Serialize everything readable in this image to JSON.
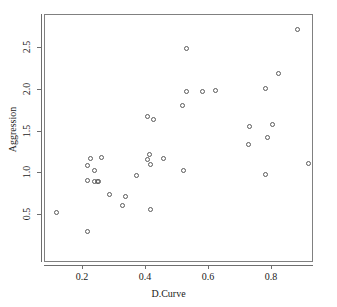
{
  "chart_data": {
    "type": "scatter",
    "title": "",
    "xlabel": "D.Curve",
    "ylabel": "Aggression",
    "xlim": [
      0.1,
      0.93
    ],
    "ylim": [
      0.28,
      2.8
    ],
    "xticks": [
      0.2,
      0.4,
      0.6,
      0.8
    ],
    "xtick_labels": [
      "0.2",
      "0.4",
      "0.6",
      "0.8"
    ],
    "yticks": [
      0.5,
      1.0,
      1.5,
      2.0,
      2.5
    ],
    "ytick_labels": [
      "0.5",
      "1.0",
      "1.5",
      "2.0",
      "2.5"
    ],
    "grid": false,
    "legend": null,
    "marker": "open-circle",
    "marker_color": "#5a5a5a",
    "points": [
      {
        "x": 0.115,
        "y": 0.53
      },
      {
        "x": 0.215,
        "y": 0.3
      },
      {
        "x": 0.285,
        "y": 0.75
      },
      {
        "x": 0.325,
        "y": 0.61
      },
      {
        "x": 0.335,
        "y": 0.72
      },
      {
        "x": 0.415,
        "y": 0.57
      },
      {
        "x": 0.215,
        "y": 0.91
      },
      {
        "x": 0.235,
        "y": 0.9
      },
      {
        "x": 0.245,
        "y": 0.9
      },
      {
        "x": 0.25,
        "y": 0.9
      },
      {
        "x": 0.215,
        "y": 1.09
      },
      {
        "x": 0.225,
        "y": 1.18
      },
      {
        "x": 0.235,
        "y": 1.03
      },
      {
        "x": 0.26,
        "y": 1.19
      },
      {
        "x": 0.37,
        "y": 0.97
      },
      {
        "x": 0.405,
        "y": 1.17
      },
      {
        "x": 0.41,
        "y": 1.22
      },
      {
        "x": 0.415,
        "y": 1.11
      },
      {
        "x": 0.455,
        "y": 1.18
      },
      {
        "x": 0.52,
        "y": 1.03
      },
      {
        "x": 0.405,
        "y": 1.68
      },
      {
        "x": 0.425,
        "y": 1.64
      },
      {
        "x": 0.515,
        "y": 1.81
      },
      {
        "x": 0.53,
        "y": 1.98
      },
      {
        "x": 0.58,
        "y": 1.98
      },
      {
        "x": 0.62,
        "y": 1.99
      },
      {
        "x": 0.53,
        "y": 2.49
      },
      {
        "x": 0.725,
        "y": 1.35
      },
      {
        "x": 0.73,
        "y": 1.56
      },
      {
        "x": 0.78,
        "y": 0.99
      },
      {
        "x": 0.785,
        "y": 1.43
      },
      {
        "x": 0.8,
        "y": 1.58
      },
      {
        "x": 0.78,
        "y": 2.01
      },
      {
        "x": 0.82,
        "y": 2.19
      },
      {
        "x": 0.88,
        "y": 2.72
      },
      {
        "x": 0.915,
        "y": 1.12
      }
    ]
  }
}
